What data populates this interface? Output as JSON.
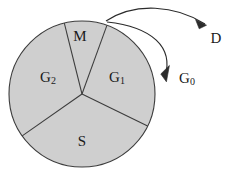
{
  "figure": {
    "background_color": "#ffffff",
    "stroke_color": "#3c3c3c",
    "fill_color": "#cfcfcf",
    "text_color": "#1a1a1a"
  },
  "circle": {
    "center_x": 82,
    "center_y": 94,
    "radius": 73
  },
  "sectors": [
    {
      "key": "M",
      "label_main": "M",
      "label_sub": "",
      "label_x": 80,
      "label_y": 36,
      "start_angle_deg": -104,
      "end_angle_deg": -70
    },
    {
      "key": "G1",
      "label_main": "G",
      "label_sub": "1",
      "label_x": 117,
      "label_y": 78,
      "start_angle_deg": -70,
      "end_angle_deg": 26
    },
    {
      "key": "S",
      "label_main": "S",
      "label_sub": "",
      "label_x": 82,
      "label_y": 141,
      "start_angle_deg": 26,
      "end_angle_deg": 145
    },
    {
      "key": "G2",
      "label_main": "G",
      "label_sub": "2",
      "label_x": 48,
      "label_y": 78,
      "start_angle_deg": 145,
      "end_angle_deg": 256
    }
  ],
  "arrows": [
    {
      "key": "D",
      "label_main": "D",
      "label_sub": "",
      "label_x": 216,
      "label_y": 38,
      "path": "M 106 21 C 135 2 175 5 205 24",
      "arrowhead": "M 205 24 L 196 20 L 200 29 Z"
    },
    {
      "key": "G0",
      "label_main": "G",
      "label_sub": "0",
      "label_x": 187,
      "label_y": 79,
      "path": "M 107 22 C 152 28 172 48 164 78",
      "arrowhead": "M 164 78 L 166 68 L 157 74 Z"
    }
  ],
  "radii": [
    {
      "key": "divider-M-left",
      "x1": 82,
      "y1": 94,
      "x2": 64.3,
      "y2": 23.2
    },
    {
      "key": "divider-M-right",
      "x1": 82,
      "y1": 94,
      "x2": 106.9,
      "y2": 25.4
    },
    {
      "key": "divider-G1-S",
      "x1": 82,
      "y1": 94,
      "x2": 147.6,
      "y2": 126.0
    },
    {
      "key": "divider-S-G2",
      "x1": 82,
      "y1": 94,
      "x2": 22.2,
      "y2": 135.9
    }
  ]
}
